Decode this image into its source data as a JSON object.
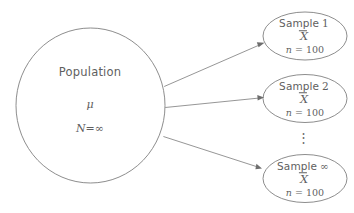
{
  "diagram": {
    "title_semantic": "sampling-distribution-diagram",
    "stroke_color": "#808080",
    "text_color": "#5f5f5f",
    "background": "#ffffff",
    "population": {
      "label": "Population",
      "mean_symbol": "μ",
      "size_symbol": "N",
      "size_equals": "=",
      "size_value": "∞"
    },
    "samples": [
      {
        "label": "Sample",
        "index": "1",
        "statistic": "X",
        "n_symbol": "n",
        "n_equals": "=",
        "n_value": "100"
      },
      {
        "label": "Sample",
        "index": "2",
        "statistic": "X",
        "n_symbol": "n",
        "n_equals": "=",
        "n_value": "100"
      },
      {
        "label": "Sample",
        "index": "∞",
        "statistic": "X",
        "n_symbol": "n",
        "n_equals": "=",
        "n_value": "100"
      }
    ],
    "continuation": "⋮",
    "arrows": [
      {
        "name": "arrow-population-to-sample-1"
      },
      {
        "name": "arrow-population-to-sample-2"
      },
      {
        "name": "arrow-population-to-sample-infinity"
      }
    ]
  }
}
